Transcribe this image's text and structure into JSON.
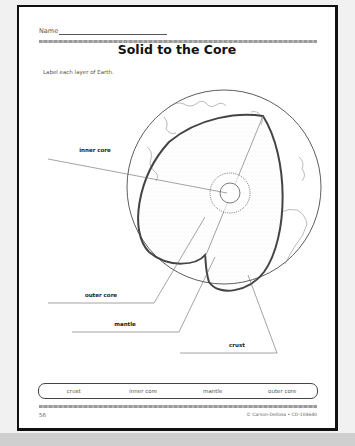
{
  "worksheet": {
    "name_label": "Name",
    "title": "Solid to the Core",
    "instructions": "Label each layer of Earth."
  },
  "diagram": {
    "labels": [
      {
        "id": "inner-core",
        "text": "inner core"
      },
      {
        "id": "outer-core",
        "text": "outer core"
      },
      {
        "id": "mantle",
        "text": "mantle"
      },
      {
        "id": "crust",
        "text": "crust"
      }
    ]
  },
  "word_bank": [
    "crust",
    "inner core",
    "mantle",
    "outer core"
  ],
  "footer": {
    "page_number": "56",
    "copyright": "© Carson-Dellosa • CD-104640"
  }
}
